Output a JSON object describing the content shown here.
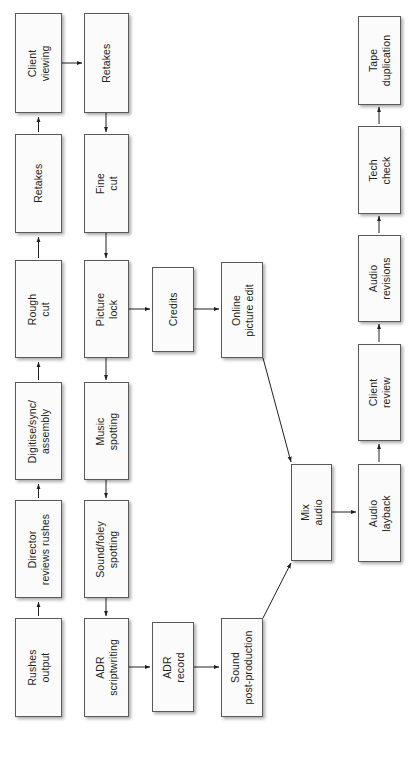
{
  "diagram": {
    "orientation": "rotated-90-ccw",
    "colors": {
      "node_fill": "#fbfbfb",
      "node_stroke": "#58595b",
      "edge_stroke": "#231f20",
      "text": "#231f20",
      "background": "#ffffff"
    },
    "nodes": [
      {
        "id": "rushes-output",
        "label": "Rushes\noutput",
        "x": 15,
        "y": 618,
        "w": 47,
        "h": 99
      },
      {
        "id": "director-reviews",
        "label": "Director\nreviews rushes",
        "x": 15,
        "y": 500,
        "w": 47,
        "h": 98
      },
      {
        "id": "digitise-sync",
        "label": "Digitise/sync/\nassembly",
        "x": 15,
        "y": 382,
        "w": 47,
        "h": 98
      },
      {
        "id": "rough-cut",
        "label": "Rough\ncut",
        "x": 15,
        "y": 260,
        "w": 47,
        "h": 98
      },
      {
        "id": "retakes-1",
        "label": "Retakes",
        "x": 15,
        "y": 134,
        "w": 47,
        "h": 99
      },
      {
        "id": "client-viewing",
        "label": "Client\nviewing",
        "x": 15,
        "y": 13,
        "w": 47,
        "h": 100
      },
      {
        "id": "adr-scriptwriting",
        "label": "ADR\nscriptwriting",
        "x": 84,
        "y": 618,
        "w": 45,
        "h": 99
      },
      {
        "id": "sound-foley-spotting",
        "label": "Sound/foley\nspotting",
        "x": 84,
        "y": 500,
        "w": 45,
        "h": 98
      },
      {
        "id": "music-spotting",
        "label": "Music\nspotting",
        "x": 84,
        "y": 382,
        "w": 45,
        "h": 98
      },
      {
        "id": "picture-lock",
        "label": "Picture\nlock",
        "x": 84,
        "y": 260,
        "w": 45,
        "h": 98
      },
      {
        "id": "fine-cut",
        "label": "Fine\ncut",
        "x": 84,
        "y": 134,
        "w": 45,
        "h": 99
      },
      {
        "id": "retakes-2",
        "label": "Retakes",
        "x": 84,
        "y": 13,
        "w": 45,
        "h": 100
      },
      {
        "id": "adr-record",
        "label": "ADR\nrecord",
        "x": 152,
        "y": 622,
        "w": 42,
        "h": 90
      },
      {
        "id": "credits",
        "label": "Credits",
        "x": 152,
        "y": 267,
        "w": 42,
        "h": 85
      },
      {
        "id": "sound-post",
        "label": "Sound\npost-production",
        "x": 221,
        "y": 618,
        "w": 42,
        "h": 99
      },
      {
        "id": "online-picture-edit",
        "label": "Online\npicture edit",
        "x": 221,
        "y": 262,
        "w": 42,
        "h": 96
      },
      {
        "id": "mix-audio",
        "label": "Mix\naudio",
        "x": 291,
        "y": 464,
        "w": 41,
        "h": 97
      },
      {
        "id": "audio-layback",
        "label": "Audio\nlayback",
        "x": 358,
        "y": 464,
        "w": 43,
        "h": 98
      },
      {
        "id": "client-review",
        "label": "Client\nreview",
        "x": 358,
        "y": 344,
        "w": 43,
        "h": 97
      },
      {
        "id": "audio-revisions",
        "label": "Audio\nrevisions",
        "x": 358,
        "y": 235,
        "w": 43,
        "h": 87
      },
      {
        "id": "tech-check",
        "label": "Tech\ncheck",
        "x": 358,
        "y": 126,
        "w": 43,
        "h": 88
      },
      {
        "id": "tape-duplication",
        "label": "Tape\nduplication",
        "x": 358,
        "y": 16,
        "w": 43,
        "h": 89
      }
    ],
    "edges": [
      {
        "id": "e-rushes-to-director",
        "from": "rushes-output",
        "to": "director-reviews",
        "kind": "vertical-up"
      },
      {
        "id": "e-director-to-digitise",
        "from": "director-reviews",
        "to": "digitise-sync",
        "kind": "vertical-up"
      },
      {
        "id": "e-digitise-to-rough",
        "from": "digitise-sync",
        "to": "rough-cut",
        "kind": "vertical-up"
      },
      {
        "id": "e-rough-to-retakes",
        "from": "rough-cut",
        "to": "retakes-1",
        "kind": "vertical-up"
      },
      {
        "id": "e-retakes-to-client-viewing",
        "from": "retakes-1",
        "to": "client-viewing",
        "kind": "vertical-up"
      },
      {
        "id": "e-client-viewing-to-retakes2",
        "from": "client-viewing",
        "to": "retakes-2",
        "kind": "horizontal-right"
      },
      {
        "id": "e-retakes2-to-fine-cut",
        "from": "retakes-2",
        "to": "fine-cut",
        "kind": "vertical-down"
      },
      {
        "id": "e-fine-cut-to-picture-lock",
        "from": "fine-cut",
        "to": "picture-lock",
        "kind": "vertical-down"
      },
      {
        "id": "e-picture-lock-to-credits",
        "from": "picture-lock",
        "to": "credits",
        "kind": "horizontal-right"
      },
      {
        "id": "e-credits-to-online",
        "from": "credits",
        "to": "online-picture-edit",
        "kind": "horizontal-right"
      },
      {
        "id": "e-picture-lock-to-music",
        "from": "picture-lock",
        "to": "music-spotting",
        "kind": "vertical-down"
      },
      {
        "id": "e-music-to-soundfoley",
        "from": "music-spotting",
        "to": "sound-foley-spotting",
        "kind": "vertical-down"
      },
      {
        "id": "e-soundfoley-to-adrscript",
        "from": "sound-foley-spotting",
        "to": "adr-scriptwriting",
        "kind": "vertical-down"
      },
      {
        "id": "e-adrscript-to-adrrecord",
        "from": "adr-scriptwriting",
        "to": "adr-record",
        "kind": "horizontal-right"
      },
      {
        "id": "e-adrrecord-to-soundpost",
        "from": "adr-record",
        "to": "sound-post",
        "kind": "horizontal-right"
      },
      {
        "id": "e-online-to-mix",
        "from": "online-picture-edit",
        "to": "mix-audio",
        "kind": "diagonal"
      },
      {
        "id": "e-soundpost-to-mix",
        "from": "sound-post",
        "to": "mix-audio",
        "kind": "diagonal"
      },
      {
        "id": "e-mix-to-layback",
        "from": "mix-audio",
        "to": "audio-layback",
        "kind": "horizontal-right"
      },
      {
        "id": "e-layback-to-client-review",
        "from": "audio-layback",
        "to": "client-review",
        "kind": "vertical-up"
      },
      {
        "id": "e-client-review-to-audiorev",
        "from": "client-review",
        "to": "audio-revisions",
        "kind": "vertical-up"
      },
      {
        "id": "e-audiorev-to-techcheck",
        "from": "audio-revisions",
        "to": "tech-check",
        "kind": "vertical-up"
      },
      {
        "id": "e-techcheck-to-tapedup",
        "from": "tech-check",
        "to": "tape-duplication",
        "kind": "vertical-up"
      }
    ],
    "edge_paths": [
      {
        "id": "p1",
        "d": "M 38.5 616 L 38.5 602",
        "arrow": "up"
      },
      {
        "id": "p2",
        "d": "M 38.5 498 L 38.5 484",
        "arrow": "up"
      },
      {
        "id": "p3",
        "d": "M 38.5 380 L 38.5 362",
        "arrow": "up"
      },
      {
        "id": "p4",
        "d": "M 38.5 258 L 38.5 237",
        "arrow": "up"
      },
      {
        "id": "p5",
        "d": "M 38.5 132 L 38.5 117",
        "arrow": "up"
      },
      {
        "id": "p6",
        "d": "M 62 63 L 82 63",
        "arrow": "right"
      },
      {
        "id": "p7",
        "d": "M 106 113 L 106 132",
        "arrow": "down"
      },
      {
        "id": "p8",
        "d": "M 106 233 L 106 258",
        "arrow": "down"
      },
      {
        "id": "p9",
        "d": "M 106 358 L 106 380",
        "arrow": "down"
      },
      {
        "id": "p10",
        "d": "M 106 480 L 106 498",
        "arrow": "down"
      },
      {
        "id": "p11",
        "d": "M 106 598 L 106 616",
        "arrow": "down"
      },
      {
        "id": "p12",
        "d": "M 129 309 L 150 309",
        "arrow": "right"
      },
      {
        "id": "p13",
        "d": "M 194 309 L 219 309",
        "arrow": "right"
      },
      {
        "id": "p14",
        "d": "M 129 667 L 150 667",
        "arrow": "right"
      },
      {
        "id": "p15",
        "d": "M 194 667 L 219 667",
        "arrow": "right"
      },
      {
        "id": "p16",
        "d": "M 263 358 L 291 462",
        "arrow": "diag-dr"
      },
      {
        "id": "p17",
        "d": "M 263 618 L 291 563",
        "arrow": "diag-ur"
      },
      {
        "id": "p18",
        "d": "M 332 512 L 356 512",
        "arrow": "right"
      },
      {
        "id": "p19",
        "d": "M 379 462 L 379 444",
        "arrow": "up"
      },
      {
        "id": "p20",
        "d": "M 379 342 L 379 324",
        "arrow": "up"
      },
      {
        "id": "p21",
        "d": "M 379 233 L 379 216",
        "arrow": "up"
      },
      {
        "id": "p22",
        "d": "M 379 124 L 379 107",
        "arrow": "up"
      }
    ]
  }
}
